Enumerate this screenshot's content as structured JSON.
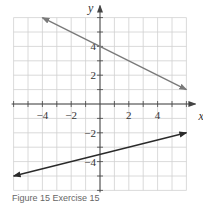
{
  "chart_data": {
    "type": "line",
    "title": "",
    "xlabel": "x",
    "ylabel": "y",
    "xlim": [
      -6,
      6
    ],
    "ylim": [
      -6,
      6
    ],
    "grid": true,
    "x_tick_labels": [
      "-4",
      "-2",
      "2",
      "4"
    ],
    "y_tick_labels": [
      "4",
      "2",
      "-2",
      "-4"
    ],
    "x_ticks": [
      -4,
      -2,
      2,
      4
    ],
    "y_ticks": [
      4,
      2,
      -2,
      -4
    ],
    "series": [
      {
        "name": "upper line",
        "color": "#7a7a7a",
        "x": [
          -4,
          6
        ],
        "y": [
          6,
          1
        ],
        "slope": -0.5,
        "intercept": 4,
        "arrows": "both"
      },
      {
        "name": "lower line",
        "color": "#2a2a2a",
        "x": [
          -6,
          6
        ],
        "y": [
          -5,
          -2
        ],
        "slope": 0.25,
        "intercept": -3.5,
        "arrows": "both"
      }
    ]
  },
  "caption": "Figure 15 Exercise 15"
}
